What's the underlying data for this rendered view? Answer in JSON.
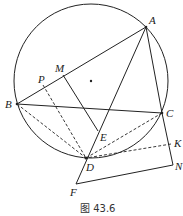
{
  "caption": "图 43.6",
  "circle": {
    "cx": 91,
    "cy": 81,
    "r": 77
  },
  "points": {
    "A": {
      "label": "A",
      "x": 146,
      "y": 27
    },
    "B": {
      "label": "B",
      "x": 17,
      "y": 104
    },
    "C": {
      "label": "C",
      "x": 162,
      "y": 113
    },
    "D": {
      "label": "D",
      "x": 86,
      "y": 158
    },
    "E": {
      "label": "E",
      "x": 98,
      "y": 131
    },
    "F": {
      "label": "F",
      "x": 76,
      "y": 184
    },
    "M": {
      "label": "M",
      "x": 63,
      "y": 75
    },
    "P": {
      "label": "P",
      "x": 43,
      "y": 85
    },
    "K": {
      "label": "K",
      "x": 171,
      "y": 144
    },
    "N": {
      "label": "N",
      "x": 173,
      "y": 165
    }
  },
  "colors": {
    "stroke": "#222222"
  }
}
